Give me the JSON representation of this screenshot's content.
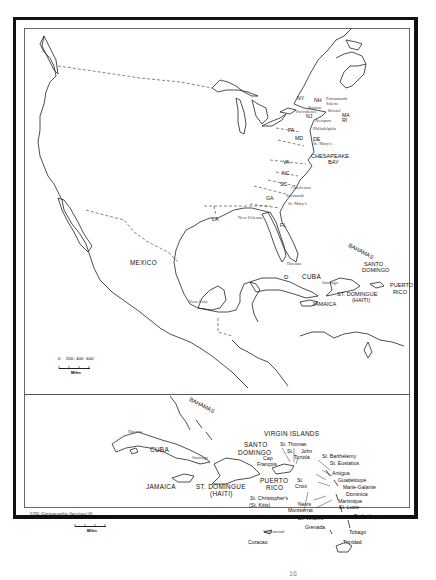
{
  "map": {
    "upper": {
      "states": [
        "NY",
        "NH",
        "MA",
        "RI",
        "NJ",
        "PA",
        "DE",
        "MD",
        "VA",
        "NC",
        "SC",
        "GA",
        "FL",
        "LA"
      ],
      "cities": [
        "Portsmouth",
        "Salem",
        "Boston",
        "Providence",
        "Bristol",
        "Newport",
        "Philadelphia",
        "St. Mary's",
        "Charleston",
        "Savannah",
        "St. Mary's",
        "New Orleans",
        "Vera Cruz",
        "Havana",
        "Santiago"
      ],
      "regions": {
        "mexico": "MEXICO",
        "chesapeake_1": "CHESAPEAKE",
        "chesapeake_2": "BAY",
        "bahamas": "BAHAMAS",
        "cuba": "CUBA",
        "jamaica": "JAMAICA",
        "santo_domingo_1": "SANTO",
        "santo_domingo_2": "DOMINGO",
        "st_domingue_1": "ST. DOMINGUE",
        "st_domingue_2": "(HAITI)",
        "puerto_rico_1": "PUERTO",
        "puerto_rico_2": "RICO",
        "d": "D"
      },
      "scale": {
        "ticks": [
          "0",
          "200",
          "400",
          "600"
        ],
        "unit": "Miles"
      }
    },
    "lower": {
      "regions": {
        "bahamas": "BAHAMAS",
        "cuba": "CUBA",
        "jamaica": "JAMAICA",
        "st_domingue_1": "ST. DOMINGUE",
        "st_domingue_2": "(HAITI)",
        "santo_domingo_1": "SANTO",
        "santo_domingo_2": "DOMINGO",
        "puerto_rico_1": "PUERTO",
        "puerto_rico_2": "RICO",
        "virgin_islands": "VIRGIN ISLANDS"
      },
      "cities": {
        "havana": "Havana",
        "santiago": "Santiago",
        "willemstad": "Willemstad"
      },
      "islands": {
        "st_thomas_1": "St. Thomas",
        "st_john_1": "St.",
        "st_john_2": "John",
        "tortola": "Tortola",
        "cap_francois_1": "Cap",
        "cap_francois_2": "François",
        "st_croix_1": "St.",
        "st_croix_2": "Croix",
        "st_christophers_1": "St. Christopher's",
        "st_christophers_2": "(St. Kitts)",
        "nevis": "Nevis",
        "montserrat": "Montserrat",
        "st_barthelemy": "St. Barthelemy",
        "st_eustatius": "St. Eustatius",
        "antigua": "Antigua",
        "guadeloupe": "Guadeloupe",
        "marie_galante": "Marie-Galante",
        "dominica": "Dominica",
        "martinique": "Martinique",
        "st_lucia": "St. Lucie",
        "barbados": "Barbados",
        "st_vincent": "St. Vincent",
        "grenada": "Grenada",
        "tobago": "Tobago",
        "trinidad": "Trinidad",
        "curacao": "Curacao"
      },
      "scale": {
        "ticks": [
          "0",
          "100",
          "200",
          "300"
        ],
        "unit": "Miles"
      }
    },
    "credit": "UNL Cartographic Services/JS",
    "page_mark": "16"
  }
}
